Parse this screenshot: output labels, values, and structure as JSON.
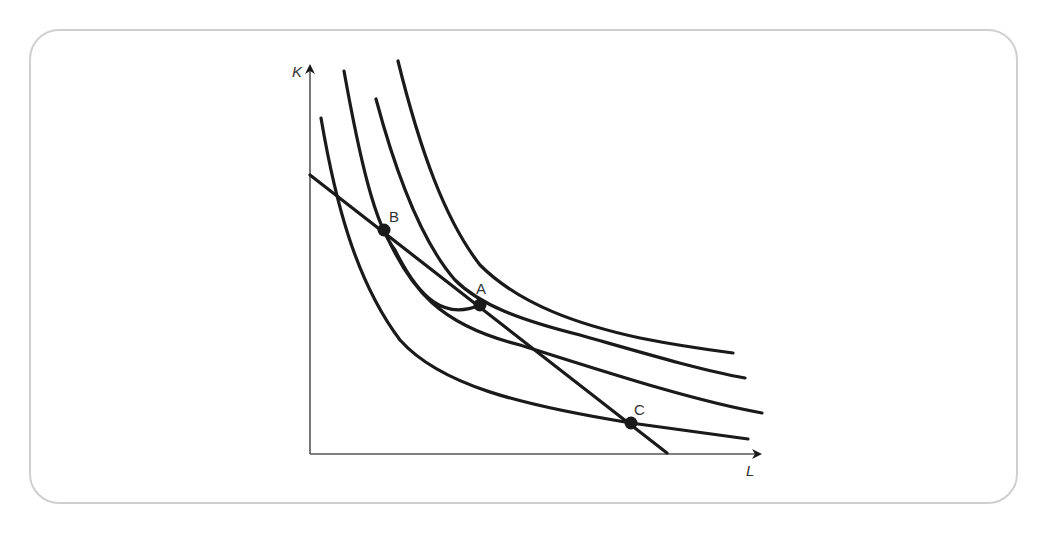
{
  "diagram": {
    "type": "isoquant-isocost",
    "axes": {
      "x_label": "L",
      "y_label": "K"
    },
    "isoquants": [
      {
        "name": "isoquant-1",
        "order": 1
      },
      {
        "name": "isoquant-2",
        "order": 2
      },
      {
        "name": "isoquant-3",
        "order": 3
      },
      {
        "name": "isoquant-4",
        "order": 4
      }
    ],
    "isocost_line": {
      "name": "isocost"
    },
    "points": [
      {
        "label": "A",
        "description": "tangency of isocost with isoquant 2"
      },
      {
        "label": "B",
        "description": "isocost intersects isoquant 1 (upper)"
      },
      {
        "label": "C",
        "description": "isocost intersects isoquant 1 (lower)"
      }
    ],
    "colors": {
      "line": "#1a1a1a",
      "axis": "#555555",
      "frame": "#cfcfcf",
      "label": "#333333"
    }
  }
}
